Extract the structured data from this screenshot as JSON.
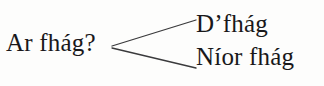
{
  "figure": {
    "type": "branching-tree-diagram",
    "language": "Irish (Gaeilge)",
    "background_color": "#fdfdfc",
    "text_color": "#19181a",
    "line_color": "#3a3a3c"
  },
  "root": {
    "label": "Ar fhág?"
  },
  "branches": [
    {
      "label": "D’fhág",
      "position": "top-right"
    },
    {
      "label": "Níor fhág",
      "position": "bottom-right"
    }
  ],
  "connectors": [
    {
      "name": "connector-to-branch-0",
      "x1": 112,
      "y1": 46,
      "x2": 196,
      "y2": 20
    },
    {
      "name": "connector-to-branch-1",
      "x1": 112,
      "y1": 48,
      "x2": 196,
      "y2": 68
    }
  ]
}
